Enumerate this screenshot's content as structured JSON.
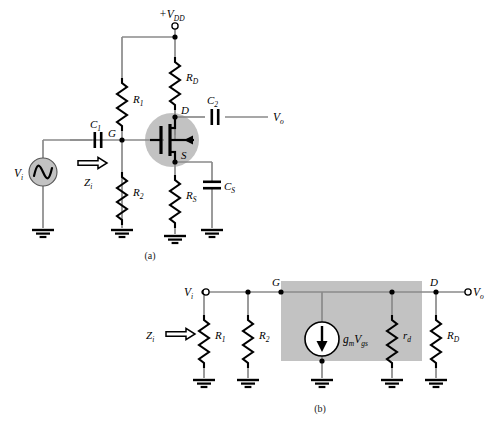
{
  "figure": {
    "title_a": "(a)",
    "title_b": "(b)",
    "accent_gray": "#bfbfbf",
    "wire_color": "#808080",
    "ink_color": "#000000"
  },
  "circuit_a": {
    "supply_label": "+V",
    "supply_sub": "DD",
    "input_source_label": "V",
    "input_source_sub": "i",
    "output_label": "V",
    "output_sub": "o",
    "impedance_label": "Z",
    "impedance_sub": "i",
    "nodes": {
      "gate": "G",
      "drain": "D",
      "source": "S"
    },
    "components": [
      {
        "name": "C",
        "sub": "1",
        "type": "capacitor"
      },
      {
        "name": "C",
        "sub": "2",
        "type": "capacitor"
      },
      {
        "name": "C",
        "sub": "S",
        "type": "capacitor"
      },
      {
        "name": "R",
        "sub": "1",
        "type": "resistor"
      },
      {
        "name": "R",
        "sub": "2",
        "type": "resistor"
      },
      {
        "name": "R",
        "sub": "D",
        "type": "resistor"
      },
      {
        "name": "R",
        "sub": "S",
        "type": "resistor"
      }
    ],
    "device": "jfet-n-channel"
  },
  "circuit_b": {
    "input_label": "V",
    "input_sub": "i",
    "output_label": "V",
    "output_sub": "o",
    "impedance_label": "Z",
    "impedance_sub": "i",
    "nodes": {
      "gate": "G",
      "drain": "D"
    },
    "current_source": {
      "prefix": "g",
      "prefix_sub": "m",
      "main": "V",
      "main_sub": "gs"
    },
    "components": [
      {
        "name": "R",
        "sub": "1",
        "type": "resistor"
      },
      {
        "name": "R",
        "sub": "2",
        "type": "resistor"
      },
      {
        "name": "r",
        "sub": "d",
        "type": "resistor"
      },
      {
        "name": "R",
        "sub": "D",
        "type": "resistor"
      }
    ]
  }
}
